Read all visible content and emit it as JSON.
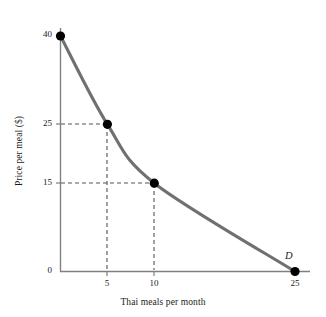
{
  "chart_data": {
    "type": "line",
    "title": "",
    "subtitle": "",
    "xlabel": "Thai meals per month",
    "ylabel": "Price per meal ($)",
    "xlim": [
      0,
      27
    ],
    "ylim": [
      0,
      43
    ],
    "grid": false,
    "legend": null,
    "curve_label": "D",
    "series": [
      {
        "name": "D",
        "points": [
          {
            "x": 0,
            "y": 40
          },
          {
            "x": 5,
            "y": 25
          },
          {
            "x": 10,
            "y": 15
          },
          {
            "x": 25,
            "y": 0
          }
        ],
        "color": "#707070"
      }
    ],
    "markers": [
      {
        "x": 0,
        "y": 40
      },
      {
        "x": 5,
        "y": 25
      },
      {
        "x": 10,
        "y": 15
      },
      {
        "x": 25,
        "y": 0
      }
    ],
    "guide_lines": [
      {
        "x": 5,
        "y": 25
      },
      {
        "x": 10,
        "y": 15
      }
    ],
    "x_ticks": [
      {
        "value": 5,
        "label": "5"
      },
      {
        "value": 10,
        "label": "10"
      },
      {
        "value": 25,
        "label": "25"
      }
    ],
    "y_ticks": [
      {
        "value": 0,
        "label": "0"
      },
      {
        "value": 15,
        "label": "15"
      },
      {
        "value": 25,
        "label": "25"
      },
      {
        "value": 40,
        "label": "40"
      }
    ],
    "colors": {
      "curve": "#707070",
      "axis": "#808080",
      "marker": "#000000",
      "dash": "#555555",
      "text": "#1a1a1a",
      "background": "#ffffff"
    }
  },
  "labels": {
    "y_40": "40",
    "y_25": "25",
    "y_15": "15",
    "y_0": "0",
    "x_5": "5",
    "x_10": "10",
    "x_25": "25",
    "x_title": "Thai meals per month",
    "y_title": "Price per meal ($)",
    "demand_curve": "D"
  }
}
